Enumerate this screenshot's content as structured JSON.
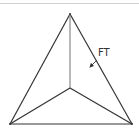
{
  "diagram": {
    "type": "triangle-with-interior-point",
    "vertices": {
      "apex": [
        70,
        14
      ],
      "bottom_left": [
        10,
        124
      ],
      "bottom_right": [
        132,
        124
      ],
      "interior": [
        70,
        88
      ]
    },
    "label": {
      "text": "FT",
      "position": [
        98,
        56
      ]
    },
    "arrow": {
      "from": [
        97,
        60
      ],
      "to": [
        89,
        68
      ]
    },
    "colors": {
      "edge": "#333333",
      "vertical_edge": "#888888",
      "top_rule": "#d0d0d0",
      "label": "#333333"
    }
  }
}
